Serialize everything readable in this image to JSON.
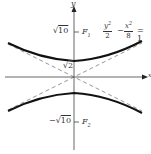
{
  "figure": {
    "equation": {
      "term1_num": "y",
      "term1_exp": "2",
      "term1_den": "2",
      "operator": "−",
      "term2_num": "x",
      "term2_exp": "2",
      "term2_den": "8",
      "equals": "= 1"
    },
    "axes": {
      "x_label": "x",
      "y_label": "y"
    },
    "labels": {
      "focus_top_value": "√10",
      "focus_top_radicand": "10",
      "focus_top_name": "F",
      "focus_top_sub": "1",
      "vertex_value_radicand": "2",
      "focus_bottom_sign": "−",
      "focus_bottom_radicand": "10",
      "focus_bottom_name": "F",
      "focus_bottom_sub": "2"
    },
    "colors": {
      "curve": "#111111",
      "axis": "#555555",
      "asymptote": "#888888",
      "text": "#333333"
    }
  }
}
